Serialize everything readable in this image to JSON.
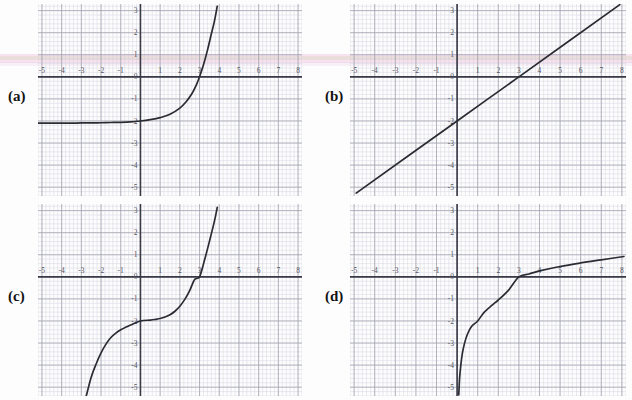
{
  "figure": {
    "panel_count": 4,
    "background_color": "#ffffff",
    "grid_minor_color": "#c9c9d6",
    "grid_major_color": "#9a9aa8",
    "axis_color": "#3a3a46",
    "curve_color": "#2b2b33",
    "tick_label_color": "#55555f",
    "label_color": "#121212"
  },
  "panels": [
    {
      "id": "a",
      "label": "(a)",
      "label_x": 8,
      "label_y": 88,
      "plot_x": 38,
      "plot_y": 4,
      "plot_w": 264,
      "plot_h": 192,
      "curve_name": "exponential-curve",
      "x_ticks": [
        "-5",
        "-4",
        "-3",
        "-2",
        "-1",
        "0",
        "1",
        "2",
        "3",
        "4",
        "5",
        "6",
        "7",
        "8"
      ],
      "y_ticks": [
        "3",
        "2",
        "1",
        "0",
        "-1",
        "-2",
        "-3",
        "-4",
        "-5"
      ],
      "xlim": [
        -5.2,
        8.2
      ],
      "ylim": [
        -5.4,
        3.3
      ],
      "chart_type": "line"
    },
    {
      "id": "b",
      "label": "(b)",
      "label_x": 325,
      "label_y": 88,
      "plot_x": 350,
      "plot_y": 4,
      "plot_w": 276,
      "plot_h": 192,
      "curve_name": "linear-curve",
      "x_ticks": [
        "-5",
        "-4",
        "-3",
        "-2",
        "-1",
        "0",
        "1",
        "2",
        "3",
        "4",
        "5",
        "6",
        "7",
        "8"
      ],
      "y_ticks": [
        "3",
        "2",
        "1",
        "0",
        "-1",
        "-2",
        "-3",
        "-4",
        "-5"
      ],
      "xlim": [
        -5.2,
        8.2
      ],
      "ylim": [
        -5.4,
        3.3
      ],
      "chart_type": "line"
    },
    {
      "id": "c",
      "label": "(c)",
      "label_x": 8,
      "label_y": 288,
      "plot_x": 38,
      "plot_y": 204,
      "plot_w": 264,
      "plot_h": 192,
      "curve_name": "cubic-curve",
      "x_ticks": [
        "-5",
        "-4",
        "-3",
        "-2",
        "-1",
        "0",
        "1",
        "2",
        "3",
        "4",
        "5",
        "6",
        "7",
        "8"
      ],
      "y_ticks": [
        "3",
        "2",
        "1",
        "0",
        "-1",
        "-2",
        "-3",
        "-4",
        "-5"
      ],
      "xlim": [
        -5.2,
        8.2
      ],
      "ylim": [
        -5.4,
        3.3
      ],
      "chart_type": "line"
    },
    {
      "id": "d",
      "label": "(d)",
      "label_x": 325,
      "label_y": 288,
      "plot_x": 350,
      "plot_y": 204,
      "plot_w": 276,
      "plot_h": 192,
      "curve_name": "logarithmic-curve",
      "x_ticks": [
        "-5",
        "-4",
        "-3",
        "-2",
        "-1",
        "0",
        "1",
        "2",
        "3",
        "4",
        "5",
        "6",
        "7",
        "8"
      ],
      "y_ticks": [
        "3",
        "2",
        "1",
        "0",
        "-1",
        "-2",
        "-3",
        "-4",
        "-5"
      ],
      "xlim": [
        -5.2,
        8.2
      ],
      "ylim": [
        -5.4,
        3.3
      ],
      "chart_type": "line"
    }
  ],
  "chart_data": [
    {
      "panel": "a",
      "type": "line",
      "title": "",
      "xlabel": "",
      "ylabel": "",
      "xlim": [
        -5.2,
        8.2
      ],
      "ylim": [
        -5.4,
        3.3
      ],
      "xticks": [
        -5,
        -4,
        -3,
        -2,
        -1,
        0,
        1,
        2,
        3,
        4,
        5,
        6,
        7,
        8
      ],
      "yticks": [
        3,
        2,
        1,
        0,
        -1,
        -2,
        -3,
        -4,
        -5
      ],
      "grid": true,
      "legend": "none",
      "description": "Increasing exponential curve with horizontal asymptote y = -2.1, crossing the x-axis near x = 3 and rising steeply to y = 3 at about x = 3.9",
      "series": [
        {
          "name": "exponential",
          "x": [
            -5.2,
            -4.5,
            -4.0,
            -3.5,
            -3.0,
            -2.5,
            -2.0,
            -1.5,
            -1.0,
            -0.5,
            0.0,
            0.5,
            1.0,
            1.5,
            2.0,
            2.3,
            2.6,
            2.85,
            3.0,
            3.2,
            3.4,
            3.6,
            3.75,
            3.9
          ],
          "y": [
            -2.1,
            -2.1,
            -2.1,
            -2.1,
            -2.09,
            -2.09,
            -2.08,
            -2.07,
            -2.06,
            -2.04,
            -2.0,
            -1.94,
            -1.85,
            -1.7,
            -1.42,
            -1.15,
            -0.78,
            -0.34,
            0.0,
            0.55,
            1.2,
            1.95,
            2.5,
            3.2
          ]
        }
      ]
    },
    {
      "panel": "b",
      "type": "line",
      "title": "",
      "xlabel": "",
      "ylabel": "",
      "xlim": [
        -5.2,
        8.2
      ],
      "ylim": [
        -5.4,
        3.3
      ],
      "xticks": [
        -5,
        -4,
        -3,
        -2,
        -1,
        0,
        1,
        2,
        3,
        4,
        5,
        6,
        7,
        8
      ],
      "yticks": [
        3,
        2,
        1,
        0,
        -1,
        -2,
        -3,
        -4,
        -5
      ],
      "grid": true,
      "legend": "none",
      "description": "Straight line of slope 2/3 with y-intercept -2, crossing the x-axis at x = 3",
      "series": [
        {
          "name": "linear",
          "slope": 0.6667,
          "intercept": -2,
          "x": [
            -4.9,
            0,
            3,
            7.9
          ],
          "y": [
            -5.27,
            -2.0,
            0.0,
            3.27
          ]
        }
      ]
    },
    {
      "panel": "c",
      "type": "line",
      "title": "",
      "xlabel": "",
      "ylabel": "",
      "xlim": [
        -5.2,
        8.2
      ],
      "ylim": [
        -5.4,
        3.3
      ],
      "xticks": [
        -5,
        -4,
        -3,
        -2,
        -1,
        0,
        1,
        2,
        3,
        4,
        5,
        6,
        7,
        8
      ],
      "yticks": [
        3,
        2,
        1,
        0,
        -1,
        -2,
        -3,
        -4,
        -5
      ],
      "grid": true,
      "legend": "none",
      "description": "Cubic curve with a flat point of inflection at (0, -2), rising through (3, 0) to y = 3 near x = 3.9 and falling to y = -5 near x = -2.6",
      "series": [
        {
          "name": "cubic",
          "x": [
            -2.75,
            -2.5,
            -2.25,
            -2.0,
            -1.75,
            -1.5,
            -1.25,
            -1.0,
            -0.75,
            -0.5,
            0.0,
            0.5,
            0.75,
            1.0,
            1.25,
            1.5,
            1.75,
            2.0,
            2.25,
            2.5,
            2.75,
            3.0,
            3.25,
            3.5,
            3.75,
            3.9
          ],
          "y": [
            -5.4,
            -4.55,
            -3.95,
            -3.45,
            -3.05,
            -2.75,
            -2.55,
            -2.4,
            -2.28,
            -2.18,
            -2.0,
            -1.96,
            -1.93,
            -1.89,
            -1.82,
            -1.72,
            -1.56,
            -1.33,
            -1.02,
            -0.62,
            -0.12,
            0.0,
            0.75,
            1.6,
            2.5,
            3.15
          ]
        }
      ]
    },
    {
      "panel": "d",
      "type": "line",
      "title": "",
      "xlabel": "",
      "ylabel": "",
      "xlim": [
        -5.2,
        8.2
      ],
      "ylim": [
        -5.4,
        3.3
      ],
      "xticks": [
        -5,
        -4,
        -3,
        -2,
        -1,
        0,
        1,
        2,
        3,
        4,
        5,
        6,
        7,
        8
      ],
      "yticks": [
        3,
        2,
        1,
        0,
        -1,
        -2,
        -3,
        -4,
        -5
      ],
      "grid": true,
      "legend": "none",
      "description": "Logarithmic curve with vertical asymptote at x = 0, passing through (1, -2) and crossing the x-axis at x = 3, reaching about y = 0.9 at x = 8",
      "series": [
        {
          "name": "logarithmic",
          "x": [
            0.08,
            0.12,
            0.18,
            0.25,
            0.35,
            0.5,
            0.7,
            1.0,
            1.3,
            1.7,
            2.0,
            2.5,
            3.0,
            3.5,
            4.0,
            5.0,
            6.0,
            7.0,
            8.1
          ],
          "y": [
            -5.35,
            -4.6,
            -4.0,
            -3.5,
            -3.05,
            -2.6,
            -2.25,
            -2.0,
            -1.62,
            -1.28,
            -1.05,
            -0.6,
            0.0,
            0.13,
            0.27,
            0.47,
            0.63,
            0.77,
            0.92
          ]
        }
      ]
    }
  ]
}
